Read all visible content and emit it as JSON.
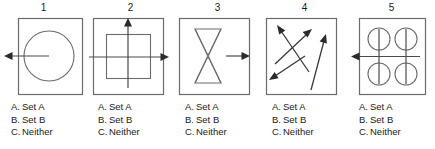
{
  "figure": {
    "background_color": "#ffffff",
    "stroke_color": "#5a5a5a",
    "text_color": "#1a1a1a",
    "panels": [
      {
        "number": "1",
        "figure_name": "circle-with-left-arrow",
        "description": "Square frame containing a circle with a horizontal line through its center ending in a leftward arrowhead outside the frame",
        "options": [
          {
            "letter": "A.",
            "label": "Set A"
          },
          {
            "letter": "B.",
            "label": "Set B"
          },
          {
            "letter": "C.",
            "label": "Neither"
          }
        ]
      },
      {
        "number": "2",
        "figure_name": "square-with-up-and-right-arrows",
        "description": "Square frame containing an inner square with a vertical line ending in an up arrowhead and a horizontal line ending in a right arrowhead",
        "options": [
          {
            "letter": "A.",
            "label": "Set A"
          },
          {
            "letter": "B.",
            "label": "Set B"
          },
          {
            "letter": "C.",
            "label": "Neither"
          }
        ]
      },
      {
        "number": "3",
        "figure_name": "hourglass-with-right-arrow",
        "description": "Square frame containing an hourglass bowtie shape with crossing center lines and a horizontal right arrow to its side",
        "options": [
          {
            "letter": "A.",
            "label": "Set A"
          },
          {
            "letter": "B.",
            "label": "Set B"
          },
          {
            "letter": "C.",
            "label": "Neither"
          }
        ]
      },
      {
        "number": "4",
        "figure_name": "three-crossing-diagonal-arrows",
        "description": "Square frame containing three crossing diagonal arrows pointing up-left, up-right and down-left",
        "options": [
          {
            "letter": "A.",
            "label": "Set A"
          },
          {
            "letter": "B.",
            "label": "Set B"
          },
          {
            "letter": "C.",
            "label": "Neither"
          }
        ]
      },
      {
        "number": "5",
        "figure_name": "four-circles-with-left-arrow",
        "description": "Square frame containing four circles in a two by two grid with a vertical line and a horizontal line ending in a left arrowhead",
        "options": [
          {
            "letter": "A.",
            "label": "Set A"
          },
          {
            "letter": "B.",
            "label": "Set B"
          },
          {
            "letter": "C.",
            "label": "Neither"
          }
        ]
      }
    ]
  }
}
